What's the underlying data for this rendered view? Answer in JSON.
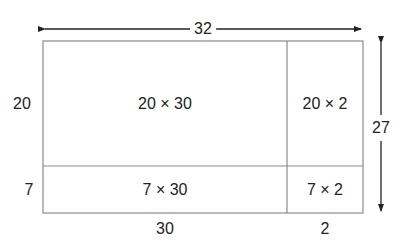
{
  "diagram": {
    "type": "area-model",
    "dimensions": {
      "total_width": "32",
      "total_height": "27",
      "width_parts": [
        "30",
        "2"
      ],
      "height_parts": [
        "20",
        "7"
      ]
    },
    "cells": {
      "top_left": "20 × 30",
      "top_right": "20 × 2",
      "bottom_left": "7 × 30",
      "bottom_right": "7 × 2"
    },
    "colors": {
      "box_stroke": "#8a8a8a",
      "arrow": "#222222",
      "text": "#222222"
    }
  }
}
